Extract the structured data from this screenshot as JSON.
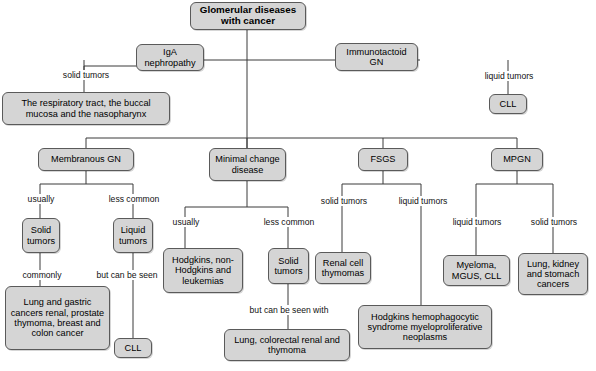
{
  "diagram": {
    "title": "Glomerular diseases with cancer",
    "type": "flowchart",
    "style": {
      "node_fill": "#d5d5d5",
      "node_border": "#5a5a5a",
      "line_color": "#3a3a3a",
      "background": "#ffffff",
      "text_color": "#000000"
    },
    "nodes": [
      {
        "id": "root",
        "label": "Glomerular diseases with cancer"
      },
      {
        "id": "iga",
        "label": "IgA nephropathy"
      },
      {
        "id": "immunotactoid",
        "label": "Immunotactoid GN"
      },
      {
        "id": "respiratory",
        "label": "The respiratory tract, the buccal mucosa and the nasopharynx"
      },
      {
        "id": "cll_right",
        "label": "CLL"
      },
      {
        "id": "membranous",
        "label": "Membranous GN"
      },
      {
        "id": "minimal",
        "label": "Minimal change disease"
      },
      {
        "id": "fsgs",
        "label": "FSGS"
      },
      {
        "id": "mpgn",
        "label": "MPGN"
      },
      {
        "id": "mem_solid",
        "label": "Solid tumors"
      },
      {
        "id": "mem_liquid",
        "label": "Liquid tumors"
      },
      {
        "id": "mem_solid_detail",
        "label": "Lung and gastric cancers renal, prostate thymoma, breast and colon cancer"
      },
      {
        "id": "mem_liquid_detail",
        "label": "CLL"
      },
      {
        "id": "mcd_hodgkins",
        "label": "Hodgkins, non-Hodgkins and leukemias"
      },
      {
        "id": "mcd_solid",
        "label": "Solid tumors"
      },
      {
        "id": "mcd_solid_detail",
        "label": "Lung, colorectal renal and thymoma"
      },
      {
        "id": "fsgs_renal",
        "label": "Renal cell thymomas"
      },
      {
        "id": "fsgs_hodgkins",
        "label": "Hodgkins hemophagocytic syndrome myeloproliferative neoplasms"
      },
      {
        "id": "mpgn_myeloma",
        "label": "Myeloma, MGUS, CLL"
      },
      {
        "id": "mpgn_lung",
        "label": "Lung, kidney and stomach cancers"
      }
    ],
    "edge_labels": [
      {
        "id": "iga_solid",
        "label": "solid tumors"
      },
      {
        "id": "immuno_liquid",
        "label": "liquid tumors"
      },
      {
        "id": "mem_usually",
        "label": "usually"
      },
      {
        "id": "mem_less_common",
        "label": "less common"
      },
      {
        "id": "mem_commonly",
        "label": "commonly"
      },
      {
        "id": "mem_but_can_be_seen",
        "label": "but can be seen"
      },
      {
        "id": "mcd_usually",
        "label": "usually"
      },
      {
        "id": "mcd_less_common",
        "label": "less common"
      },
      {
        "id": "mcd_but_can_be_seen_with",
        "label": "but can be seen with"
      },
      {
        "id": "fsgs_solid",
        "label": "solid tumors"
      },
      {
        "id": "fsgs_liquid",
        "label": "liquid tumors"
      },
      {
        "id": "mpgn_liquid",
        "label": "liquid tumors"
      },
      {
        "id": "mpgn_solid",
        "label": "solid tumors"
      }
    ]
  }
}
